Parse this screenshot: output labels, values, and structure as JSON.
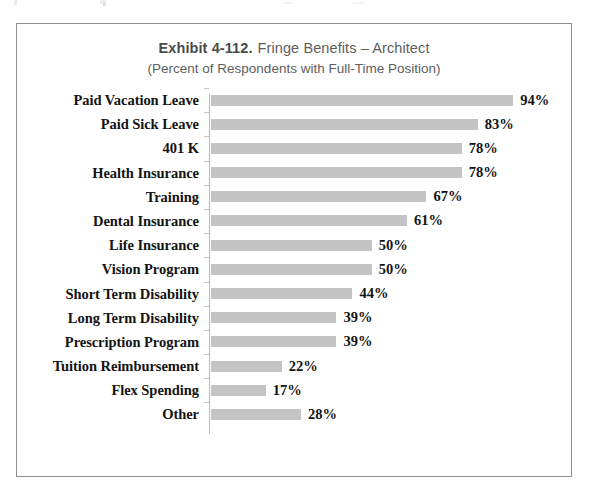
{
  "frame": {
    "border_color": "#8d8f91"
  },
  "title": {
    "exhibit": "Exhibit 4-112.",
    "name": "Fringe Benefits – Architect",
    "subtitle": "(Percent of Respondents with Full-Time Position)"
  },
  "style": {
    "bar_color": "#c4c4c4",
    "axis_color": "#b9b9b9",
    "label_color": "#131313",
    "title_color": "#5e5e5e"
  },
  "chart_data": {
    "type": "bar",
    "orientation": "horizontal",
    "subtitle": "(Percent of Respondents with Full-Time Position)",
    "xlabel": "",
    "ylabel": "",
    "xlim": [
      0,
      100
    ],
    "grid": false,
    "legend": false,
    "value_suffix": "%",
    "categories": [
      "Paid Vacation Leave",
      "Paid Sick Leave",
      "401 K",
      "Health Insurance",
      "Training",
      "Dental Insurance",
      "Life Insurance",
      "Vision Program",
      "Short Term Disability",
      "Long Term Disability",
      "Prescription Program",
      "Tuition Reimbursement",
      "Flex Spending",
      "Other"
    ],
    "values": [
      94,
      83,
      78,
      78,
      67,
      61,
      50,
      50,
      44,
      39,
      39,
      22,
      17,
      28
    ],
    "value_labels": [
      "94%",
      "83%",
      "78%",
      "78%",
      "67%",
      "61%",
      "50%",
      "50%",
      "44%",
      "39%",
      "39%",
      "22%",
      "17%",
      "28%"
    ]
  }
}
